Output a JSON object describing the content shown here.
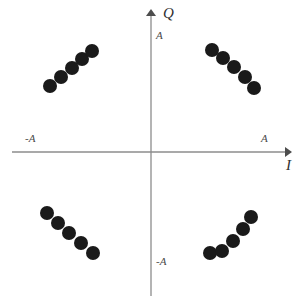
{
  "figure": {
    "title": "",
    "background_color": "#ffffff",
    "width": 302,
    "height": 301
  },
  "axes": {
    "origin": {
      "x": 151,
      "y": 152
    },
    "color": "#8c8c8c",
    "q_axis": {
      "name": "Q",
      "arrow_tip": {
        "x": 151,
        "y": 9
      },
      "line_end": {
        "x": 151,
        "y": 296
      },
      "positive_tick_label": "A",
      "negative_tick_label": "-A"
    },
    "i_axis": {
      "name": "I",
      "arrow_tip": {
        "x": 292,
        "y": 152
      },
      "line_start": {
        "x": 12,
        "y": 152
      },
      "positive_tick_label": "A",
      "negative_tick_label": "-A"
    }
  },
  "chart_data": {
    "type": "scatter",
    "title": "",
    "xlabel": "I",
    "ylabel": "Q",
    "xlim": [
      -1.35,
      1.35
    ],
    "ylim": [
      -1.35,
      1.35
    ],
    "xticks": [
      -1,
      1
    ],
    "xticklabels": [
      "-A",
      "A"
    ],
    "yticks": [
      -1,
      1
    ],
    "yticklabels": [
      "-A",
      "A"
    ],
    "grid": false,
    "legend": null,
    "marker": {
      "shape": "circle",
      "color": "#1a1a1a",
      "diameter_px": 14
    },
    "series": [
      {
        "name": "Quadrant II cluster",
        "color": "#1a1a1a",
        "points_px": [
          {
            "x": 50,
            "y": 86
          },
          {
            "x": 61,
            "y": 77
          },
          {
            "x": 72,
            "y": 68
          },
          {
            "x": 82,
            "y": 59
          },
          {
            "x": 92,
            "y": 51
          }
        ]
      },
      {
        "name": "Quadrant I cluster",
        "color": "#1a1a1a",
        "points_px": [
          {
            "x": 212,
            "y": 50
          },
          {
            "x": 223,
            "y": 58
          },
          {
            "x": 234,
            "y": 67
          },
          {
            "x": 245,
            "y": 77
          },
          {
            "x": 254,
            "y": 88
          }
        ]
      },
      {
        "name": "Quadrant III cluster",
        "color": "#1a1a1a",
        "points_px": [
          {
            "x": 47,
            "y": 213
          },
          {
            "x": 58,
            "y": 223
          },
          {
            "x": 69,
            "y": 233
          },
          {
            "x": 81,
            "y": 243
          },
          {
            "x": 93,
            "y": 253
          }
        ]
      },
      {
        "name": "Quadrant IV cluster",
        "color": "#1a1a1a",
        "points_px": [
          {
            "x": 210,
            "y": 253
          },
          {
            "x": 222,
            "y": 251
          },
          {
            "x": 233,
            "y": 241
          },
          {
            "x": 243,
            "y": 229
          },
          {
            "x": 251,
            "y": 217
          }
        ]
      }
    ]
  }
}
